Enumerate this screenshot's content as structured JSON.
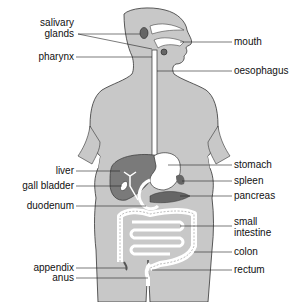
{
  "diagram": {
    "colors": {
      "body": "#c8c8c8",
      "body_outline": "#333333",
      "liver": "#7a7a7a",
      "organ_light": "#ffffff",
      "organ_dark": "#666666",
      "leader_line": "#222222"
    },
    "labels_left": [
      {
        "id": "salivary-glands",
        "text_line1": "salivary",
        "text_line2": "glands"
      },
      {
        "id": "pharynx",
        "text": "pharynx"
      },
      {
        "id": "liver",
        "text": "liver"
      },
      {
        "id": "gall-bladder",
        "text": "gall bladder"
      },
      {
        "id": "duodenum",
        "text": "duodenum"
      },
      {
        "id": "appendix",
        "text": "appendix"
      },
      {
        "id": "anus",
        "text": "anus"
      }
    ],
    "labels_right": [
      {
        "id": "mouth",
        "text": "mouth"
      },
      {
        "id": "oesophagus",
        "text": "oesophagus"
      },
      {
        "id": "stomach",
        "text": "stomach"
      },
      {
        "id": "spleen",
        "text": "spleen"
      },
      {
        "id": "pancreas",
        "text": "pancreas"
      },
      {
        "id": "small-intestine",
        "text_line1": "small",
        "text_line2": "intestine"
      },
      {
        "id": "colon",
        "text": "colon"
      },
      {
        "id": "rectum",
        "text": "rectum"
      }
    ]
  }
}
